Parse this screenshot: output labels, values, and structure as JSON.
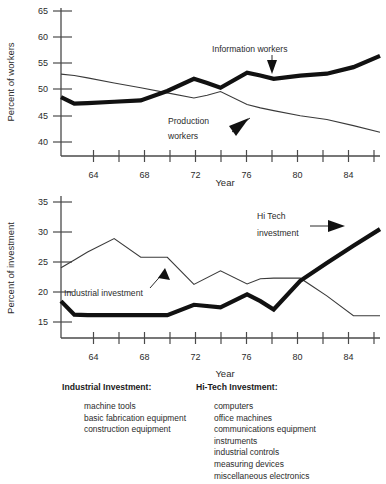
{
  "figure": {
    "title": "",
    "charts": [
      {
        "id": "workers",
        "ylabel": "Percent of workers",
        "xlabel": "Year",
        "annotations": [
          {
            "name": "information-workers",
            "line1": "Information workers",
            "line2": ""
          },
          {
            "name": "production-workers",
            "line1": "Production",
            "line2": "workers"
          }
        ]
      },
      {
        "id": "investment",
        "ylabel": "Percent of investment",
        "xlabel": "Year",
        "annotations": [
          {
            "name": "hi-tech-investment",
            "line1": "Hi Tech",
            "line2": "investment"
          },
          {
            "name": "industrial-investment",
            "line1": "Industrial investment",
            "line2": ""
          }
        ]
      }
    ]
  },
  "legend": {
    "columns": [
      {
        "name": "industrial-investment",
        "heading": "Industrial Investment:",
        "items": [
          "machine tools",
          "basic fabrication equipment",
          "construction equipment"
        ]
      },
      {
        "name": "hi-tech-investment",
        "heading": "Hi-Tech Investment:",
        "items": [
          "computers",
          "office machines",
          "communications equipment",
          "instruments",
          "industrial controls",
          "measuring devices",
          "miscellaneous electronics"
        ]
      }
    ]
  },
  "chart_data": [
    {
      "type": "line",
      "title": "",
      "xlabel": "Year",
      "ylabel": "Percent of workers",
      "xlim": [
        62,
        86
      ],
      "ylim": [
        38,
        66
      ],
      "yticks": [
        40,
        45,
        50,
        55,
        60,
        65
      ],
      "xticks": [
        64,
        66,
        68,
        70,
        72,
        74,
        76,
        78,
        80,
        82,
        84,
        86
      ],
      "xticklabels": [
        "64",
        "",
        "68",
        "",
        "72",
        "",
        "76",
        "",
        "80",
        "",
        "84",
        ""
      ],
      "grid": false,
      "legend_position": "inline-annotation",
      "x": [
        62,
        63,
        64,
        66,
        68,
        70,
        72,
        73,
        74,
        76,
        77,
        78,
        80,
        82,
        84,
        86
      ],
      "series": [
        {
          "name": "Information workers",
          "style": "thick",
          "values": [
            47.6,
            46.2,
            46.3,
            46.6,
            46.9,
            48.9,
            51.5,
            50.6,
            49.6,
            52.8,
            52.2,
            51.5,
            52.2,
            52.6,
            54.0,
            56.4
          ]
        },
        {
          "name": "Production workers",
          "style": "thin",
          "values": [
            52.5,
            52.2,
            51.7,
            50.6,
            49.6,
            48.5,
            47.4,
            48.0,
            48.8,
            46.0,
            45.3,
            44.7,
            43.6,
            42.8,
            41.5,
            40.1
          ]
        }
      ]
    },
    {
      "type": "line",
      "title": "",
      "xlabel": "Year",
      "ylabel": "Percent of investment",
      "xlim": [
        62,
        86
      ],
      "ylim": [
        13,
        36
      ],
      "yticks": [
        15,
        20,
        25,
        30,
        35
      ],
      "xticks": [
        64,
        66,
        68,
        70,
        72,
        74,
        76,
        78,
        80,
        82,
        84,
        86
      ],
      "xticklabels": [
        "64",
        "",
        "68",
        "",
        "72",
        "",
        "76",
        "",
        "80",
        "",
        "84",
        ""
      ],
      "grid": false,
      "legend_position": "inline-annotation",
      "x": [
        62,
        63,
        64,
        66,
        68,
        70,
        72,
        74,
        76,
        77,
        78,
        80,
        82,
        84,
        86
      ],
      "series": [
        {
          "name": "Industrial investment",
          "style": "thin",
          "values": [
            23.4,
            24.9,
            26.4,
            29.0,
            25.4,
            25.4,
            20.2,
            22.8,
            20.3,
            21.3,
            21.4,
            21.4,
            18.0,
            14.2,
            14.2
          ]
        },
        {
          "name": "Hi Tech investment",
          "style": "thick",
          "values": [
            17.0,
            14.4,
            14.3,
            14.3,
            14.3,
            14.3,
            16.3,
            15.8,
            18.3,
            17.0,
            15.4,
            20.9,
            24.3,
            27.6,
            30.8
          ]
        }
      ]
    }
  ]
}
